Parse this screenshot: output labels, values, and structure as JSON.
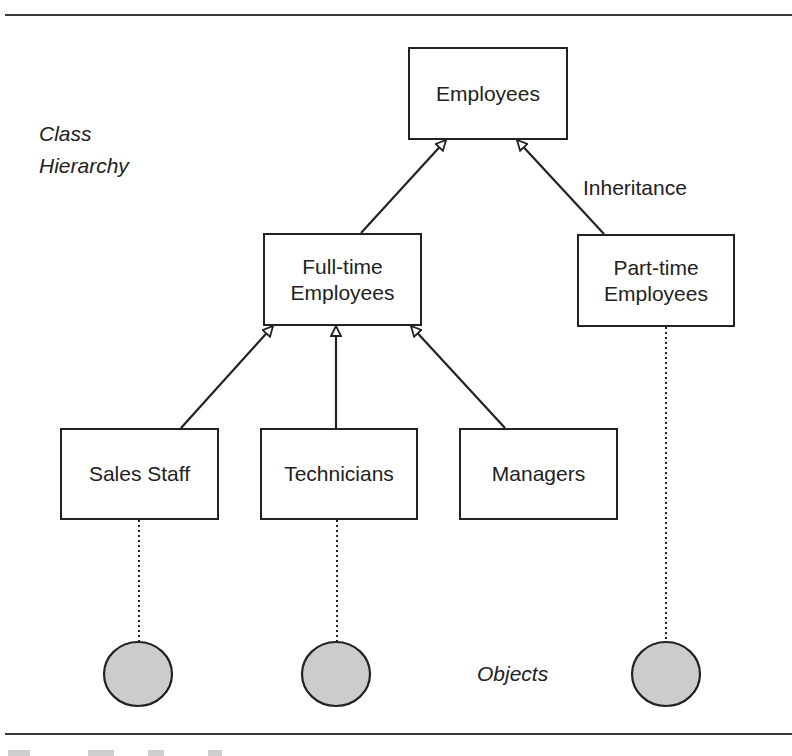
{
  "diagram": {
    "title_label": [
      "Class",
      "Hierarchy"
    ],
    "objects_label": "Objects",
    "relationship_label": "Inheritance",
    "classes": {
      "root": "Employees",
      "full_time": [
        "Full-time",
        "Employees"
      ],
      "part_time": [
        "Part-time",
        "Employees"
      ],
      "sales_staff": "Sales Staff",
      "technicians": "Technicians",
      "managers": "Managers"
    },
    "edges": [
      {
        "from": "Full-time Employees",
        "to": "Employees",
        "type": "inheritance"
      },
      {
        "from": "Part-time Employees",
        "to": "Employees",
        "type": "inheritance"
      },
      {
        "from": "Sales Staff",
        "to": "Full-time Employees",
        "type": "inheritance"
      },
      {
        "from": "Technicians",
        "to": "Full-time Employees",
        "type": "inheritance"
      },
      {
        "from": "Managers",
        "to": "Full-time Employees",
        "type": "inheritance"
      },
      {
        "from": "Sales Staff",
        "to": "object",
        "type": "instance"
      },
      {
        "from": "Technicians",
        "to": "object",
        "type": "instance"
      },
      {
        "from": "Part-time Employees",
        "to": "object",
        "type": "instance"
      }
    ],
    "colors": {
      "line": "#222222",
      "object_fill": "#cccccc",
      "object_stroke": "#222222"
    }
  }
}
